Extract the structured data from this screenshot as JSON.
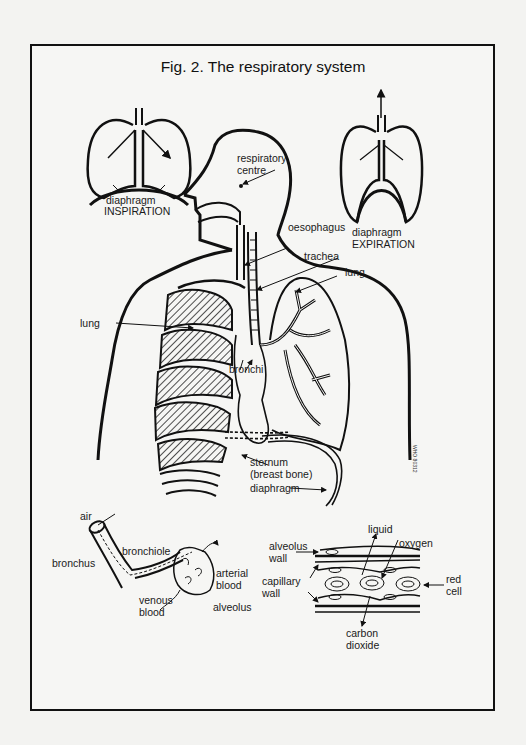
{
  "figure": {
    "title": "Fig. 2. The respiratory system",
    "stamp": "WHO 80312"
  },
  "insets": {
    "inspiration": {
      "diaphragm_label": "diaphragm",
      "caption": "INSPIRATION"
    },
    "expiration": {
      "diaphragm_label": "diaphragm",
      "caption": "EXPIRATION"
    }
  },
  "main_labels": {
    "respiratory_centre_1": "respiratory",
    "respiratory_centre_2": "centre",
    "oesophagus": "oesophagus",
    "trachea": "trachea",
    "lung_right": "lung",
    "lung_left": "lung",
    "bronchi": "bronchi",
    "sternum_1": "sternum",
    "sternum_2": "(breast bone)",
    "diaphragm": "diaphragm"
  },
  "bronchiole_panel": {
    "air": "air",
    "bronchus": "bronchus",
    "bronchiole": "bronchiole",
    "arterial_1": "arterial",
    "arterial_2": "blood",
    "venous_1": "venous",
    "venous_2": "blood",
    "alveolus": "alveolus"
  },
  "exchange_panel": {
    "alveolus_wall_1": "alveolus",
    "alveolus_wall_2": "wall",
    "capillary_wall_1": "capillary",
    "capillary_wall_2": "wall",
    "liquid": "liquid",
    "oxygen": "oxygen",
    "red_cell_1": "red",
    "red_cell_2": "cell",
    "carbon_dioxide_1": "carbon",
    "carbon_dioxide_2": "dioxide"
  }
}
